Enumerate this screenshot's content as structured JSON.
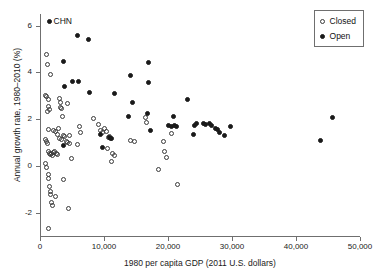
{
  "chart_data": {
    "type": "scatter",
    "title": "",
    "xlabel": "1980 per capita GDP (2011 U.S. dollars)",
    "ylabel": "Annual growth rate, 1980–2010 (%)",
    "xlim": [
      0,
      50000
    ],
    "ylim": [
      -3.0,
      6.5
    ],
    "xticks": [
      0,
      10000,
      20000,
      30000,
      40000,
      50000
    ],
    "xticklabels": [
      "0",
      "10,000",
      "20,000",
      "30,000",
      "40,000",
      "50,000"
    ],
    "yticks": [
      -2,
      0,
      2,
      4,
      6
    ],
    "yticklabels": [
      "-2",
      "0",
      "2",
      "4",
      "6"
    ],
    "grid": false,
    "legend": {
      "position": "top-right",
      "entries": [
        {
          "label": "Closed",
          "marker": "open-circle"
        },
        {
          "label": "Open",
          "marker": "filled-circle"
        }
      ]
    },
    "annotations": [
      {
        "text": "CHN",
        "x": 1500,
        "y": 6.2,
        "series": "Open"
      }
    ],
    "series": [
      {
        "name": "Closed",
        "marker": "open-circle",
        "points": [
          [
            1050,
            4.75
          ],
          [
            1100,
            4.35
          ],
          [
            1600,
            3.92
          ],
          [
            900,
            3.02
          ],
          [
            1000,
            2.95
          ],
          [
            1300,
            2.82
          ],
          [
            1250,
            2.55
          ],
          [
            1150,
            2.33
          ],
          [
            1450,
            2.4
          ],
          [
            3000,
            2.88
          ],
          [
            3150,
            2.7
          ],
          [
            3250,
            2.52
          ],
          [
            3400,
            2.45
          ],
          [
            4300,
            2.65
          ],
          [
            3500,
            2.1
          ],
          [
            2950,
            1.62
          ],
          [
            1400,
            1.55
          ],
          [
            2100,
            1.5
          ],
          [
            2400,
            1.47
          ],
          [
            6150,
            1.68
          ],
          [
            6300,
            1.42
          ],
          [
            5900,
            0.92
          ],
          [
            900,
            1.12
          ],
          [
            1000,
            1.05
          ],
          [
            1200,
            0.95
          ],
          [
            1350,
            0.62
          ],
          [
            1500,
            0.55
          ],
          [
            1650,
            0.48
          ],
          [
            1750,
            0.52
          ],
          [
            1900,
            0.45
          ],
          [
            2050,
            0.58
          ],
          [
            2250,
            0.6
          ],
          [
            2550,
            0.52
          ],
          [
            2800,
            0.5
          ],
          [
            3050,
            1.18
          ],
          [
            3300,
            1.12
          ],
          [
            3650,
            1.3
          ],
          [
            3800,
            1.25
          ],
          [
            4100,
            1.05
          ],
          [
            4350,
            1.0
          ],
          [
            4550,
            0.96
          ],
          [
            4900,
            0.3
          ],
          [
            4650,
            1.28
          ],
          [
            2700,
            1.35
          ],
          [
            900,
            0.12
          ],
          [
            1050,
            -0.08
          ],
          [
            1250,
            -0.35
          ],
          [
            1400,
            -0.55
          ],
          [
            1500,
            -0.88
          ],
          [
            1700,
            -1.1
          ],
          [
            1600,
            -1.22
          ],
          [
            1850,
            -1.55
          ],
          [
            2000,
            -1.68
          ],
          [
            2400,
            -1.32
          ],
          [
            3650,
            -0.58
          ],
          [
            4450,
            -1.82
          ],
          [
            1300,
            -2.7
          ],
          [
            8300,
            2.02
          ],
          [
            9100,
            1.78
          ],
          [
            9500,
            1.52
          ],
          [
            9800,
            1.42
          ],
          [
            10100,
            1.6
          ],
          [
            10400,
            1.48
          ],
          [
            10700,
            1.22
          ],
          [
            11000,
            1.18
          ],
          [
            10850,
            1.25
          ],
          [
            11300,
            0.52
          ],
          [
            11600,
            0.45
          ],
          [
            11100,
            0.2
          ],
          [
            10500,
            0.75
          ],
          [
            14200,
            1.1
          ],
          [
            14800,
            1.05
          ],
          [
            16500,
            2.08
          ],
          [
            16700,
            1.85
          ],
          [
            19300,
            1.05
          ],
          [
            19500,
            0.62
          ],
          [
            19800,
            0.35
          ],
          [
            18500,
            -0.15
          ],
          [
            21500,
            -0.8
          ],
          [
            20600,
            1.38
          ]
        ]
      },
      {
        "name": "Open",
        "marker": "filled-circle",
        "points": [
          [
            1500,
            6.2
          ],
          [
            5800,
            5.6
          ],
          [
            7600,
            5.42
          ],
          [
            3600,
            4.45
          ],
          [
            16900,
            4.42
          ],
          [
            14200,
            3.88
          ],
          [
            6000,
            3.62
          ],
          [
            5000,
            3.6
          ],
          [
            16900,
            3.58
          ],
          [
            3900,
            3.38
          ],
          [
            7800,
            3.15
          ],
          [
            11700,
            3.1
          ],
          [
            14500,
            2.72
          ],
          [
            23100,
            2.85
          ],
          [
            16800,
            2.25
          ],
          [
            20800,
            2.12
          ],
          [
            13900,
            2.12
          ],
          [
            20100,
            1.75
          ],
          [
            20600,
            1.7
          ],
          [
            21000,
            1.72
          ],
          [
            21300,
            1.68
          ],
          [
            24100,
            1.75
          ],
          [
            24400,
            1.8
          ],
          [
            25600,
            1.82
          ],
          [
            25900,
            1.78
          ],
          [
            26500,
            1.8
          ],
          [
            26800,
            1.75
          ],
          [
            27400,
            1.62
          ],
          [
            27700,
            1.55
          ],
          [
            28100,
            1.45
          ],
          [
            29700,
            1.68
          ],
          [
            28800,
            1.32
          ],
          [
            24000,
            1.35
          ],
          [
            17200,
            1.5
          ],
          [
            9400,
            1.35
          ],
          [
            9700,
            0.8
          ],
          [
            10900,
            1.22
          ],
          [
            11200,
            1.18
          ],
          [
            3600,
            0.88
          ],
          [
            45700,
            2.05
          ],
          [
            43900,
            1.08
          ]
        ]
      }
    ]
  }
}
